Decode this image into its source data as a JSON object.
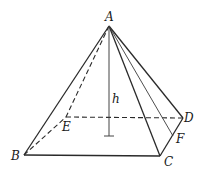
{
  "figure": {
    "type": "square pyramid",
    "vertices": {
      "A": {
        "label": "A",
        "x": 109,
        "y": 26
      },
      "B": {
        "label": "B",
        "x": 24,
        "y": 155
      },
      "C": {
        "label": "C",
        "x": 160,
        "y": 156
      },
      "D": {
        "label": "D",
        "x": 183,
        "y": 118
      },
      "E": {
        "label": "E",
        "x": 66,
        "y": 117
      },
      "F": {
        "label": "F",
        "x": 173,
        "y": 136
      }
    },
    "height_label": "h",
    "visible_edges": [
      "AB",
      "AC",
      "AD",
      "BC",
      "CD",
      "AF"
    ],
    "hidden_edges": [
      "AE",
      "BE",
      "ED"
    ],
    "height_segment": {
      "from": "A",
      "to_y": 136
    }
  }
}
